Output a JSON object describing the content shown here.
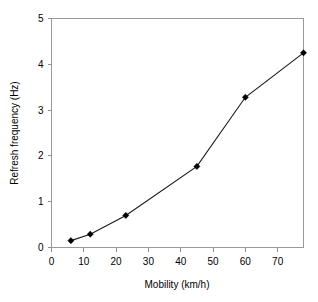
{
  "chart_data": {
    "type": "line",
    "title": "",
    "xlabel": "Mobility (km/h)",
    "ylabel": "Refresh frequency (Hz)",
    "xlim": [
      0,
      78
    ],
    "ylim": [
      0,
      5
    ],
    "xticks": [
      0,
      10,
      20,
      30,
      40,
      50,
      60,
      70
    ],
    "yticks": [
      0,
      1,
      2,
      3,
      4,
      5
    ],
    "xtick_labels": [
      "0",
      "10",
      "20",
      "30",
      "40",
      "50",
      "60",
      "70"
    ],
    "ytick_labels": [
      "0",
      "1",
      "2",
      "3",
      "4",
      "5"
    ],
    "grid": false,
    "legend": false,
    "marker": "filled-diamond",
    "x": [
      6,
      12,
      23,
      45,
      60,
      78
    ],
    "values": [
      0.15,
      0.29,
      0.7,
      1.77,
      3.28,
      4.25
    ],
    "series": [
      {
        "name": "Refresh frequency",
        "x": [
          6,
          12,
          23,
          45,
          60,
          78
        ],
        "values": [
          0.15,
          0.29,
          0.7,
          1.77,
          3.28,
          4.25
        ]
      }
    ]
  },
  "axes": {
    "x_title": "Mobility (km/h)",
    "y_title": "Refresh frequency (Hz)"
  },
  "colors": {
    "line": "#1a1a1a",
    "marker": "#000000",
    "frame": "#9a9a9a",
    "background": "#ffffff"
  }
}
